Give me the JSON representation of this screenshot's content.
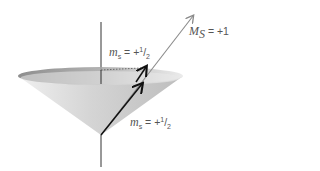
{
  "diagram": {
    "labels": {
      "total": {
        "symbol": "M",
        "subscript": "S",
        "value": "= +1"
      },
      "upper_spin": {
        "symbol": "m",
        "subscript": "s",
        "value": "= +",
        "num": "1",
        "den": "2"
      },
      "lower_spin": {
        "symbol": "m",
        "subscript": "s",
        "value": "= +",
        "num": "1",
        "den": "2"
      }
    },
    "colors": {
      "cone_light": "#e6e6e6",
      "cone_dark": "#9a9a9a",
      "rim": "#8c8c8c",
      "axis": "#333333",
      "resultant_arrow": "#8a8a8a",
      "spin_arrows": "#111111",
      "text": "#555555"
    }
  }
}
